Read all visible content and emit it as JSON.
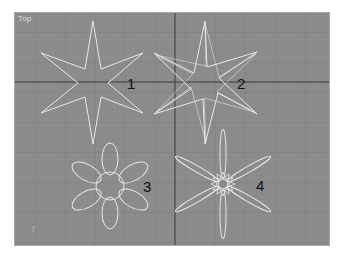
{
  "viewport": {
    "label": "Top",
    "background": "#8c8c8c",
    "grid_minor_color": "#848484",
    "grid_major_color": "#787878",
    "axis_color": "#3a3a3a",
    "shape_color": "#e8e8e8",
    "axis_gizmo": "z"
  },
  "shapes": [
    {
      "id": "star-1",
      "label": "1"
    },
    {
      "id": "star-2",
      "label": "2"
    },
    {
      "id": "flower-3",
      "label": "3"
    },
    {
      "id": "flower-4",
      "label": "4"
    }
  ]
}
